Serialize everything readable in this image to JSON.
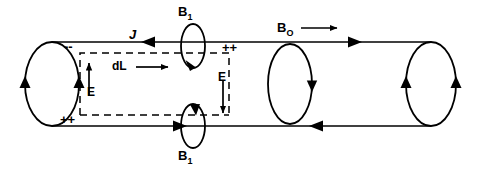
{
  "figure": {
    "type": "physics-vector-diagram",
    "stroke_color": "#000000",
    "background_color": "#ffffff",
    "labels": {
      "b1_top": "B",
      "b1_top_sub": "1",
      "b1_bottom": "B",
      "b1_bottom_sub": "1",
      "b0": "B",
      "b0_sub": "O",
      "current_density": "J",
      "length_element": "dL",
      "e_field_left": "E",
      "e_field_right": "E",
      "charge_top_left": "--",
      "charge_bottom_left": "++",
      "charge_top_right": "++"
    },
    "elements": {
      "ellipses": [
        {
          "name": "left-end-cap",
          "cx": 52,
          "cy": 84,
          "rx": 27,
          "ry": 42,
          "arrow_dirs": [
            "down-left",
            "down-right"
          ]
        },
        {
          "name": "middle-loop",
          "cx": 290,
          "cy": 84,
          "rx": 22,
          "ry": 40,
          "arrow_dirs": [
            "up-right"
          ]
        },
        {
          "name": "right-end-cap",
          "cx": 431,
          "cy": 84,
          "rx": 25,
          "ry": 42,
          "arrow_dirs": [
            "down-left",
            "down-right"
          ]
        },
        {
          "name": "b1-top-loop",
          "cx": 193,
          "cy": 46,
          "rx": 12,
          "ry": 22,
          "arrow_dirs": [
            "down-right"
          ]
        },
        {
          "name": "b1-bottom-loop",
          "cx": 193,
          "cy": 126,
          "rx": 12,
          "ry": 22,
          "arrow_dirs": [
            "up-left"
          ]
        }
      ],
      "lines": [
        {
          "name": "top-surface-line",
          "x1": 52,
          "y1": 42,
          "x2": 431,
          "y2": 42,
          "arrows": [
            "left-at-146",
            "right-at-348"
          ]
        },
        {
          "name": "bottom-surface-line",
          "x1": 52,
          "y1": 126,
          "x2": 431,
          "y2": 126,
          "arrows": [
            "right-at-173",
            "left-at-323"
          ]
        }
      ],
      "dashed_rectangle": {
        "name": "integration-contour",
        "x": 80,
        "y": 53,
        "width": 149,
        "height": 62
      },
      "vectors": [
        {
          "name": "e-left-vector",
          "direction": "up",
          "x": 87,
          "y1": 96,
          "y2": 62
        },
        {
          "name": "e-right-vector",
          "direction": "down",
          "x": 222,
          "y1": 80,
          "y2": 114
        },
        {
          "name": "dl-vector",
          "direction": "right",
          "y": 67,
          "x1": 136,
          "x2": 170
        },
        {
          "name": "b0-vector",
          "direction": "right",
          "y": 28,
          "x1": 300,
          "x2": 338
        }
      ]
    }
  }
}
